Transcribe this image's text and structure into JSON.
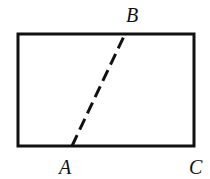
{
  "diagram": {
    "rectangle": {
      "x": 18,
      "y": 34,
      "width": 176,
      "height": 112,
      "stroke": "#111111",
      "stroke_width": 3
    },
    "segment_AB": {
      "style": "dashed",
      "from": "A",
      "to": "B"
    },
    "points": {
      "A": {
        "label": "A",
        "x": 72,
        "y": 146
      },
      "B": {
        "label": "B",
        "x": 125,
        "y": 34
      },
      "C": {
        "label": "C",
        "x": 194,
        "y": 146
      }
    }
  }
}
